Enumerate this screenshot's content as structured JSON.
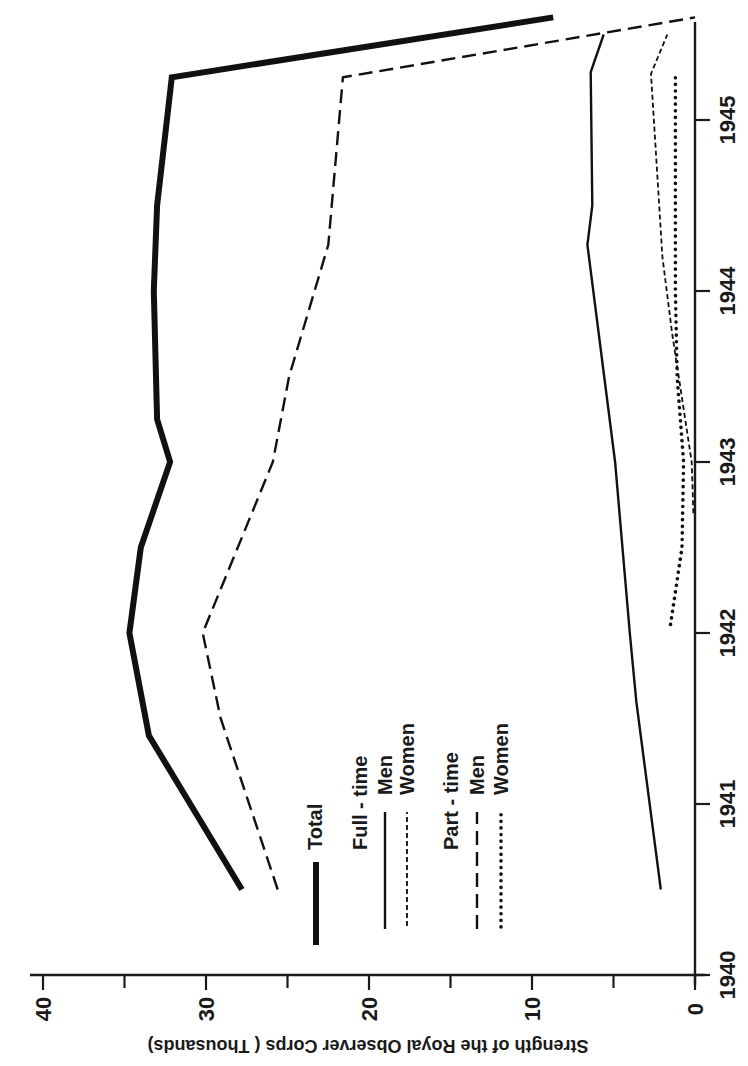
{
  "chart_data": {
    "type": "line",
    "title": "",
    "orientation": "rotated 90 degrees counter-clockwise (years run bottom-to-top along right edge, values run right-to-left along bottom edge)",
    "xlabel": "",
    "ylabel": "Strength of the Royal Observer Corps ( Thousands)",
    "xlim": [
      1940,
      1945.6
    ],
    "ylim": [
      0,
      40
    ],
    "x_ticks": [
      "1940",
      "1941",
      "1942",
      "1943",
      "1944",
      "1945"
    ],
    "y_ticks": [
      "0",
      "10",
      "20",
      "30",
      "40"
    ],
    "y_minor_ticks": [
      5,
      15,
      25,
      35
    ],
    "grid": false,
    "legend_position": "inside, center-left of plot",
    "legend": {
      "total": "Total",
      "fulltime_header": "Full - time",
      "parttime_header": "Part - time",
      "men": "Men",
      "women": "Women"
    },
    "series": [
      {
        "name": "Total",
        "style": "thick solid",
        "x": [
          1940.5,
          1941.4,
          1942.0,
          1942.5,
          1943.0,
          1943.25,
          1944.0,
          1944.5,
          1945.25,
          1945.6
        ],
        "values": [
          27.8,
          33.5,
          34.7,
          34.0,
          32.2,
          33.0,
          33.2,
          33.0,
          32.1,
          8.7
        ]
      },
      {
        "name": "Full-time Men",
        "style": "thin solid",
        "x": [
          1940.5,
          1941.6,
          1942.0,
          1943.0,
          1944.27,
          1944.5,
          1945.28,
          1945.5
        ],
        "values": [
          2.1,
          3.6,
          4.0,
          4.9,
          6.6,
          6.3,
          6.4,
          5.6
        ]
      },
      {
        "name": "Full-time Women",
        "style": "fine dashed",
        "x": [
          1942.7,
          1943.0,
          1943.75,
          1944.2,
          1945.27,
          1945.5
        ],
        "values": [
          0.1,
          0.2,
          1.4,
          2.0,
          2.7,
          1.7
        ]
      },
      {
        "name": "Part-time Men",
        "style": "long dashed",
        "x": [
          1940.5,
          1941.5,
          1942.0,
          1943.0,
          1943.5,
          1944.27,
          1945.25,
          1945.6
        ],
        "values": [
          25.6,
          29.1,
          30.2,
          25.9,
          24.9,
          22.5,
          21.6,
          0.0
        ]
      },
      {
        "name": "Part-time Women",
        "style": "dotted",
        "x": [
          1942.05,
          1942.5,
          1943.0,
          1943.5,
          1944.0,
          1945.25
        ],
        "values": [
          1.5,
          0.8,
          0.7,
          1.1,
          1.2,
          1.2
        ]
      }
    ]
  },
  "layout": {
    "origin_px": [
      695,
      975
    ],
    "px_per_thousand": 16.3,
    "px_per_year": 171,
    "axis_top_y": 22,
    "axis_left_x": 30
  }
}
